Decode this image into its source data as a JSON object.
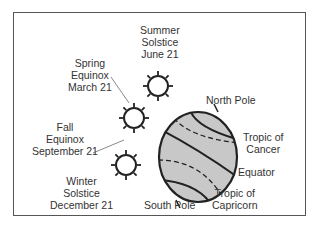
{
  "diagram": {
    "type": "earth-seasons",
    "labels": {
      "summer": [
        "Summer",
        "Solstice",
        "June 21"
      ],
      "spring": [
        "Spring",
        "Equinox",
        "March 21"
      ],
      "fall": [
        "Fall",
        "Equinox",
        "September 21"
      ],
      "winter": [
        "Winter",
        "Solstice",
        "December 21"
      ],
      "north_pole": "North Pole",
      "south_pole": "South Pole",
      "tropic_cancer": [
        "Tropic of",
        "Cancer"
      ],
      "equator": "Equator",
      "tropic_capricorn": [
        "Tropic of",
        "Capricorn"
      ]
    },
    "colors": {
      "globe_fill": "#c8c8c8",
      "stroke": "#222222",
      "frame": "#555555"
    }
  }
}
